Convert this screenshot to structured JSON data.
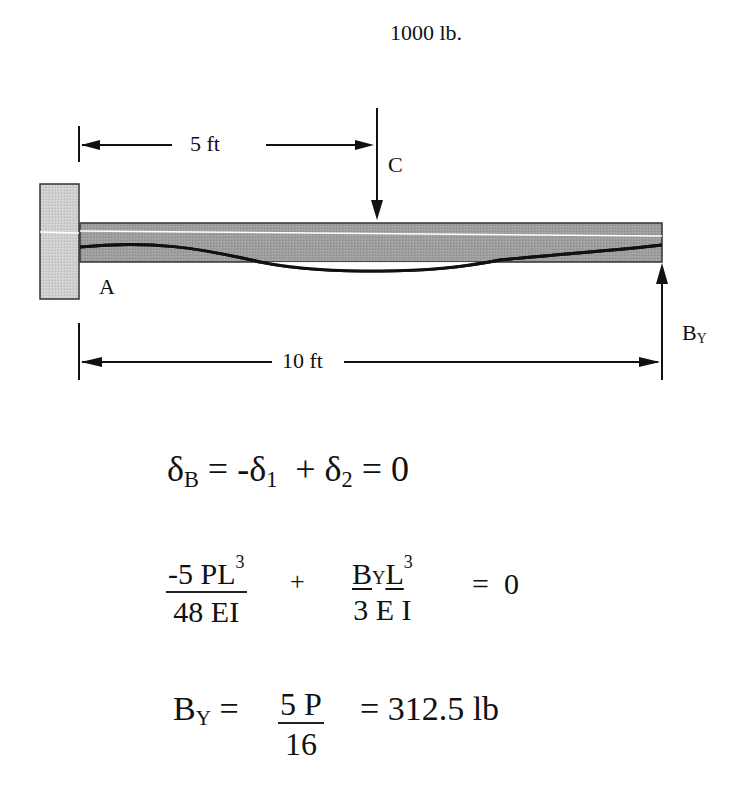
{
  "diagram": {
    "load_label": "1000 lb.",
    "point_c_label": "C",
    "point_a_label": "A",
    "reaction_label": {
      "main": "B",
      "sub": "Y"
    },
    "dim_short": "5 ft",
    "dim_long": "10 ft",
    "colors": {
      "beam_fill": "#9a9a9a",
      "wall_fill": "#c8c8c8",
      "line": "#111111",
      "highlight": "#ffffff"
    }
  },
  "equations": {
    "eq1": {
      "delta": "δ",
      "sub_b": "B",
      "eq": " = ",
      "minus_delta": "-δ",
      "sub_1": "1",
      "plus": "  + δ",
      "sub_2": "2",
      "tail": " = 0"
    },
    "eq2": {
      "frac1_num": "-5 PL",
      "frac1_num_sup": "3",
      "frac1_den": "48 EI",
      "plus": "+",
      "frac2_num_b": "B",
      "frac2_num_y": "Y",
      "frac2_num_l": "L",
      "frac2_num_sup": "3",
      "frac2_den": "3 E I",
      "rhs": "=  0"
    },
    "eq3": {
      "lhs_main": "B",
      "lhs_sub": "Y",
      "eq": " = ",
      "frac_num": "5 P",
      "frac_den": "16",
      "rhs": "= 312.5 lb"
    }
  }
}
